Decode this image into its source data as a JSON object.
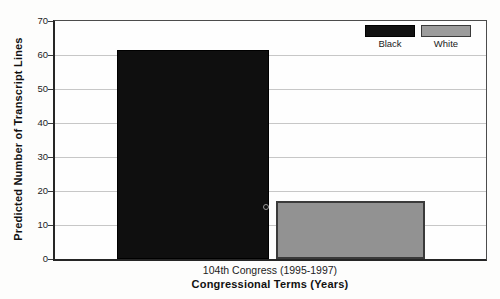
{
  "figure": {
    "y_axis_title": "Predicted Number of Transcript Lines",
    "x_axis_title": "Congressional Terms (Years)",
    "x_tick_label": "104th Congress (1995-1997)"
  },
  "legend": {
    "items": [
      {
        "label": "Black",
        "color": "#111111"
      },
      {
        "label": "White",
        "color": "#9c9c9c"
      }
    ]
  },
  "chart_data": {
    "type": "bar",
    "title": "",
    "xlabel": "Congressional Terms (Years)",
    "ylabel": "Predicted Number of Transcript Lines",
    "categories": [
      "104th Congress (1995-1997)"
    ],
    "series": [
      {
        "name": "Black",
        "values": [
          61.5
        ],
        "color": "#0f0f0f"
      },
      {
        "name": "White",
        "values": [
          17
        ],
        "color": "#929292"
      }
    ],
    "ylim": [
      0,
      70
    ],
    "yticks": [
      0,
      10,
      20,
      30,
      40,
      50,
      60,
      70
    ],
    "grid": true,
    "legend_position": "top-right-inside"
  },
  "colors": {
    "bar_black": "#0f0f0f",
    "bar_white": "#929292",
    "gridline": "#c7c7c7",
    "axis": "#262626",
    "text": "#1a1a1a"
  }
}
